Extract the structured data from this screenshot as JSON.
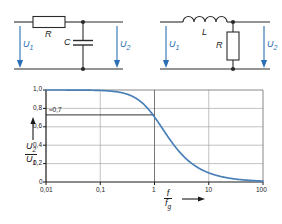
{
  "figure": {
    "kind": "textbook-figure-lowpass-filter",
    "background_color": "#ffffff",
    "accent_color": "#2b6fb5",
    "curve_color": "#4a80b8",
    "wire_color": "#2b2b2b",
    "grid_color": "#9a9a9a"
  },
  "circuits": [
    {
      "id": "rc-lowpass",
      "series_element_label": "R",
      "shunt_element_label": "C",
      "input_label": "U",
      "input_sub": "1",
      "output_label": "U",
      "output_sub": "2"
    },
    {
      "id": "lr-lowpass",
      "series_element_label": "L",
      "shunt_element_label": "R",
      "input_label": "U",
      "input_sub": "1",
      "output_label": "U",
      "output_sub": "2"
    }
  ],
  "chart_data": {
    "type": "line",
    "title": "",
    "xlabel_num": "f",
    "xlabel_den": "f",
    "xlabel_den_sub": "g",
    "ylabel_num": "U",
    "ylabel_num_sub": "2",
    "ylabel_den": "U",
    "ylabel_den_sub": "1",
    "xscale": "log",
    "xlim": [
      0.01,
      100
    ],
    "ylim": [
      0,
      1.0
    ],
    "grid": true,
    "legend": "none",
    "xticks": [
      0.01,
      0.1,
      1,
      10,
      100
    ],
    "xticklabels": [
      "0,01",
      "0,1",
      "1",
      "10",
      "100"
    ],
    "yticks": [
      0,
      0.2,
      0.4,
      0.6,
      0.8,
      1.0
    ],
    "yticklabels": [
      "0",
      "0,2",
      "0,4",
      "0,6",
      "0,8",
      "1,0"
    ],
    "annotations": [
      {
        "text": "≈0,7",
        "y_value": 0.707,
        "x_from": 0.01,
        "x_to": 1,
        "kind": "horizontal-marker-line"
      }
    ],
    "series": [
      {
        "name": "|U2/U1|",
        "formula": "1/sqrt(1+(f/fg)^2)",
        "x": [
          0.01,
          0.02,
          0.05,
          0.1,
          0.2,
          0.3,
          0.5,
          0.7,
          1.0,
          1.5,
          2.0,
          3.0,
          5.0,
          7.0,
          10.0,
          20.0,
          50.0,
          100.0
        ],
        "values": [
          1.0,
          1.0,
          0.999,
          0.995,
          0.981,
          0.958,
          0.894,
          0.819,
          0.707,
          0.555,
          0.447,
          0.316,
          0.196,
          0.141,
          0.0995,
          0.05,
          0.02,
          0.01
        ]
      }
    ]
  }
}
